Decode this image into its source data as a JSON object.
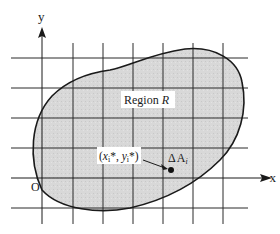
{
  "diagram": {
    "axes": {
      "x_label": "x",
      "y_label": "y",
      "origin_label": "O"
    },
    "region": {
      "label_prefix": "Region ",
      "label_var": "R",
      "fill_color": "#d6d6d6",
      "outline_color": "#1a1a1a"
    },
    "grid": {
      "line_color": "#2a2a2a",
      "vertical_lines": 7,
      "horizontal_lines": 6
    },
    "sample_point": {
      "label_open": "(",
      "x_var": "x",
      "x_sub": "i",
      "star": "*",
      "sep": ", ",
      "y_var": "y",
      "y_sub": "i",
      "label_close": "*)",
      "area_label_delta": "Δ",
      "area_label_A": "A",
      "area_label_sub": "i"
    }
  }
}
